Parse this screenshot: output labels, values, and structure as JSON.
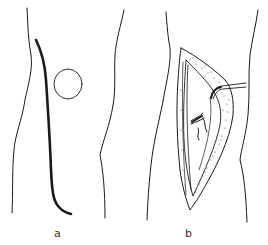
{
  "figure": {
    "panels": [
      {
        "label": "a",
        "description": "Limb outline with thick planned incision line and circular marking",
        "elements": [
          "limb-outline-left",
          "limb-outline-right",
          "incision-line",
          "circle-marking"
        ]
      },
      {
        "label": "b",
        "description": "Limb outline with opened elongated surgical incision, stippled wound edges, exposed structures and a retractor",
        "elements": [
          "limb-outline-left",
          "limb-outline-right",
          "opened-incision",
          "retractor",
          "exposed-structure"
        ]
      }
    ],
    "colors": {
      "background": "#ffffff",
      "line": "#1a1a1a",
      "stipple": "#444444"
    }
  }
}
